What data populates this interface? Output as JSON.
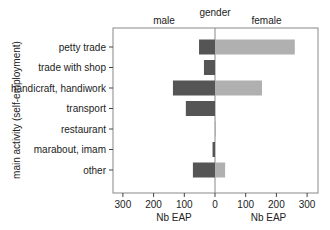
{
  "chart_data": {
    "type": "bar",
    "orientation": "horizontal",
    "layout": "back-to-back",
    "title": "gender",
    "panels": [
      "male",
      "female"
    ],
    "ylabel": "main activity (self-employment)",
    "xlabel_left": "Nb EAP",
    "xlabel_right": "Nb EAP",
    "xlim": [
      0,
      330
    ],
    "x_ticks": [
      300,
      200,
      100,
      0
    ],
    "x_ticks_right": [
      0,
      100,
      200,
      300
    ],
    "grid": false,
    "categories": [
      "petty trade",
      "trade with shop",
      "handicraft, handiwork",
      "transport",
      "restaurant",
      "marabout, imam",
      "other"
    ],
    "series": [
      {
        "name": "male",
        "color": "#555555",
        "values": [
          52,
          36,
          137,
          95,
          0,
          8,
          72
        ]
      },
      {
        "name": "female",
        "color": "#b0b0b0",
        "values": [
          260,
          0,
          153,
          0,
          3,
          0,
          33
        ]
      }
    ]
  }
}
